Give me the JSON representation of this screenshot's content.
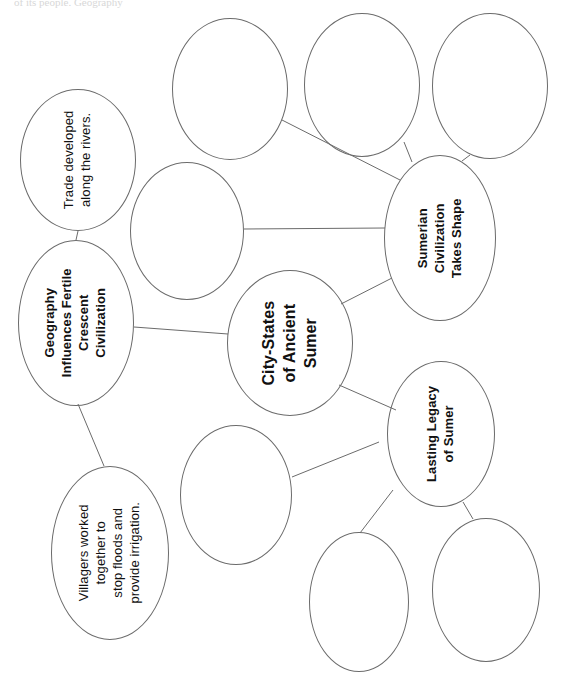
{
  "page": {
    "width": 561,
    "height": 682,
    "background_color": "#ffffff",
    "stroke_color": "#6b6b6b",
    "text_color": "#111111",
    "text_orientation": "rotated-90-ccw",
    "top_edge_artifact": "of its people. Geography"
  },
  "nodes": [
    {
      "id": "trade-rivers",
      "label": "Trade developed\nalong the rivers.",
      "bold": false,
      "font_size": 13,
      "cx": 78,
      "cy": 160,
      "rx": 58,
      "ry": 71
    },
    {
      "id": "geography-fertile-crescent",
      "label": "Geography\nInfluences Fertile\nCrescent Civilization",
      "bold": true,
      "font_size": 13,
      "cx": 76,
      "cy": 323,
      "rx": 58,
      "ry": 83
    },
    {
      "id": "villagers-irrigation",
      "label": "Villagers worked\ntogether to\nstop floods and\nprovide irrigation.",
      "bold": false,
      "font_size": 13,
      "cx": 110,
      "cy": 553,
      "rx": 59,
      "ry": 87
    },
    {
      "id": "city-states-of-ancient-sumer",
      "label": "City-States\nof Ancient\nSumer",
      "bold": true,
      "font_size": 16,
      "cx": 290,
      "cy": 343,
      "rx": 63,
      "ry": 73
    },
    {
      "id": "sumerian-civilization-takes-shape",
      "label": "Sumerian\nCivilization\nTakes Shape",
      "bold": true,
      "font_size": 13,
      "cx": 440,
      "cy": 238,
      "rx": 56,
      "ry": 83
    },
    {
      "id": "lasting-legacy-of-sumer",
      "label": "Lasting Legacy\nof Sumer",
      "bold": true,
      "font_size": 13,
      "cx": 441,
      "cy": 434,
      "rx": 54,
      "ry": 73
    },
    {
      "id": "blank-top-left",
      "label": "",
      "bold": false,
      "font_size": 13,
      "cx": 230,
      "cy": 89,
      "rx": 58,
      "ry": 71
    },
    {
      "id": "blank-top-center",
      "label": "",
      "bold": false,
      "font_size": 13,
      "cx": 362,
      "cy": 85,
      "rx": 58,
      "ry": 72
    },
    {
      "id": "blank-top-right",
      "label": "",
      "bold": false,
      "font_size": 13,
      "cx": 490,
      "cy": 86,
      "rx": 58,
      "ry": 73
    },
    {
      "id": "blank-mid-left",
      "label": "",
      "bold": false,
      "font_size": 13,
      "cx": 187,
      "cy": 231,
      "rx": 57,
      "ry": 69
    },
    {
      "id": "blank-bottom-left",
      "label": "",
      "bold": false,
      "font_size": 13,
      "cx": 236,
      "cy": 495,
      "rx": 56,
      "ry": 70
    },
    {
      "id": "blank-bottom-center",
      "label": "",
      "bold": false,
      "font_size": 13,
      "cx": 359,
      "cy": 602,
      "rx": 50,
      "ry": 70
    },
    {
      "id": "blank-bottom-right",
      "label": "",
      "bold": false,
      "font_size": 13,
      "cx": 486,
      "cy": 590,
      "rx": 54,
      "ry": 72
    }
  ],
  "edges": [
    {
      "id": "edge-geography-to-trade",
      "from": "geography-fertile-crescent",
      "to": "trade-rivers",
      "x1": 76,
      "y1": 240,
      "x2": 78,
      "y2": 231
    },
    {
      "id": "edge-geography-to-villagers",
      "from": "geography-fertile-crescent",
      "to": "villagers-irrigation",
      "x1": 78,
      "y1": 404,
      "x2": 104,
      "y2": 466
    },
    {
      "id": "edge-geography-to-city-states",
      "from": "geography-fertile-crescent",
      "to": "city-states-of-ancient-sumer",
      "x1": 134,
      "y1": 327,
      "x2": 228,
      "y2": 334
    },
    {
      "id": "edge-city-states-to-sumerian",
      "from": "city-states-of-ancient-sumer",
      "to": "sumerian-civilization-takes-shape",
      "x1": 341,
      "y1": 304,
      "x2": 392,
      "y2": 278
    },
    {
      "id": "edge-city-states-to-legacy",
      "from": "city-states-of-ancient-sumer",
      "to": "lasting-legacy-of-sumer",
      "x1": 339,
      "y1": 385,
      "x2": 396,
      "y2": 410
    },
    {
      "id": "edge-sumerian-to-blank-mid-left",
      "from": "sumerian-civilization-takes-shape",
      "to": "blank-mid-left",
      "x1": 385,
      "y1": 228,
      "x2": 244,
      "y2": 229
    },
    {
      "id": "edge-sumerian-to-blank-top-left",
      "from": "sumerian-civilization-takes-shape",
      "to": "blank-top-left",
      "x1": 400,
      "y1": 180,
      "x2": 282,
      "y2": 120
    },
    {
      "id": "edge-sumerian-to-blank-top-center",
      "from": "sumerian-civilization-takes-shape",
      "to": "blank-top-center",
      "x1": 412,
      "y1": 162,
      "x2": 404,
      "y2": 142
    },
    {
      "id": "edge-sumerian-to-blank-top-right",
      "from": "sumerian-civilization-takes-shape",
      "to": "blank-top-right",
      "x1": 462,
      "y1": 161,
      "x2": 470,
      "y2": 155
    },
    {
      "id": "edge-legacy-to-blank-bottom-left",
      "from": "lasting-legacy-of-sumer",
      "to": "blank-bottom-left",
      "x1": 379,
      "y1": 442,
      "x2": 292,
      "y2": 477
    },
    {
      "id": "edge-legacy-to-blank-bottom-center",
      "from": "lasting-legacy-of-sumer",
      "to": "blank-bottom-center",
      "x1": 393,
      "y1": 490,
      "x2": 360,
      "y2": 533
    },
    {
      "id": "edge-legacy-to-blank-bottom-right",
      "from": "lasting-legacy-of-sumer",
      "to": "blank-bottom-right",
      "x1": 463,
      "y1": 502,
      "x2": 473,
      "y2": 519
    }
  ]
}
